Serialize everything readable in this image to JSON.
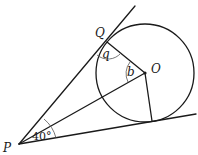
{
  "diagram": {
    "type": "geometry",
    "points": {
      "P": {
        "label": "P",
        "x": 19,
        "y": 144
      },
      "Q": {
        "label": "Q",
        "x": 107,
        "y": 42
      },
      "O": {
        "label": "O",
        "x": 145,
        "y": 73
      },
      "T": {
        "label": "",
        "x": 152,
        "y": 121
      }
    },
    "circle": {
      "cx": 145,
      "cy": 73,
      "r": 49
    },
    "angles": {
      "at_P": {
        "label": "40°",
        "value": 40
      },
      "q": {
        "label": "q"
      },
      "b": {
        "label": "b"
      }
    },
    "colors": {
      "stroke": "#1a1a1a",
      "background": "#ffffff"
    }
  }
}
